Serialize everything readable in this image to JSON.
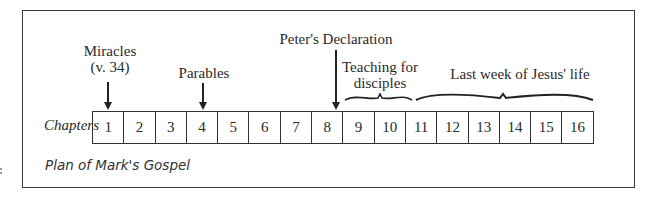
{
  "diagram": {
    "title": "Plan of Mark's Gospel",
    "row_label": "Chapters",
    "chapters": [
      "1",
      "2",
      "3",
      "4",
      "5",
      "6",
      "7",
      "8",
      "9",
      "10",
      "11",
      "12",
      "13",
      "14",
      "15",
      "16"
    ],
    "annotations": [
      {
        "id": "miracles",
        "label_line1": "Miracles",
        "label_line2": "(v. 34)",
        "type": "arrow",
        "chapter": "1"
      },
      {
        "id": "parables",
        "label_line1": "Parables",
        "type": "arrow",
        "chapter": "4"
      },
      {
        "id": "peters-declaration",
        "label_line1": "Peter's Declaration",
        "type": "arrow",
        "chapter": "8"
      },
      {
        "id": "teaching-for-disciples",
        "label_line1": "Teaching for",
        "label_line2": "disciples",
        "type": "brace",
        "chapters": [
          "9",
          "10"
        ]
      },
      {
        "id": "last-week",
        "label_line1": "Last week of Jesus' life",
        "type": "brace",
        "chapters": [
          "11",
          "12",
          "13",
          "14",
          "15",
          "16"
        ]
      }
    ],
    "colors": {
      "line": "#333333",
      "text": "#2a2a2a",
      "background": "#ffffff"
    }
  }
}
